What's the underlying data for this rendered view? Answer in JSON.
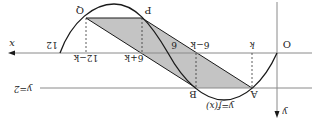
{
  "figure": {
    "orientation": "rotated-180",
    "labels": {
      "origin": "O",
      "x_axis": "x",
      "y_axis": "y",
      "curve": "y=f(x)",
      "line": "y=2",
      "point_A": "A",
      "point_B": "B",
      "point_P": "P",
      "point_Q": "Q",
      "tick_k": "k",
      "tick_6_minus_k": "6−k",
      "tick_6": "6",
      "tick_6_plus_k": "6+k",
      "tick_12_minus_k": "12−k",
      "tick_12": "12"
    },
    "colors": {
      "stroke": "#1a1a1a",
      "shade": "#bdbdbd",
      "axis_line": "#9a9a9a"
    }
  }
}
